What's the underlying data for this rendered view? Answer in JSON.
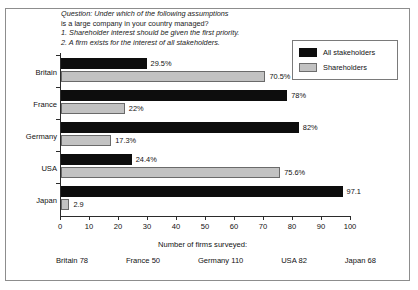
{
  "question": {
    "lines": [
      "Question: Under which of the following assumptions",
      "is a large company in your country managed?",
      "1. Shareholder interest should be given the first priority.",
      "2. A firm exists for the interest of all stakeholders."
    ]
  },
  "legend": {
    "entries": [
      {
        "label": "All stakeholders",
        "color": "#0d0d0d"
      },
      {
        "label": "Shareholders",
        "color": "#c2c2c2"
      }
    ]
  },
  "footer": {
    "title": "Number of firms surveyed:",
    "counts": [
      "Britain 78",
      "France 50",
      "Germany 110",
      "USA 82",
      "Japan 68"
    ]
  },
  "chart_data": {
    "type": "bar",
    "orientation": "horizontal",
    "title": "",
    "xlabel": "",
    "ylabel": "",
    "xlim": [
      0,
      100
    ],
    "xticks": [
      0,
      10,
      20,
      30,
      40,
      50,
      60,
      70,
      80,
      90,
      100
    ],
    "grid": false,
    "legend_position": "top-right",
    "categories": [
      "Britain",
      "France",
      "Germany",
      "USA",
      "Japan"
    ],
    "series": [
      {
        "name": "All stakeholders",
        "color": "#0d0d0d",
        "values": [
          29.5,
          78,
          82,
          24.4,
          97.1
        ],
        "labels": [
          "29.5%",
          "78%",
          "82%",
          "24.4%",
          "97.1"
        ]
      },
      {
        "name": "Shareholders",
        "color": "#c2c2c2",
        "values": [
          70.5,
          22,
          17.3,
          75.6,
          2.9
        ],
        "labels": [
          "70.5%",
          "22%",
          "17.3%",
          "75.6%",
          "2.9"
        ]
      }
    ]
  }
}
